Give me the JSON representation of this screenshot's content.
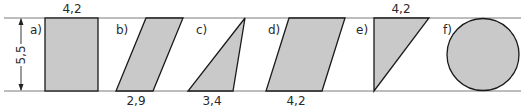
{
  "figure": {
    "height_label": "5,5",
    "fill_color": "#c9c9c9",
    "stroke_color": "#1a1a1a",
    "shapes": [
      {
        "id": "a",
        "label": "a)",
        "type": "rectangle",
        "dimension": "4,2",
        "dimension_position": "top"
      },
      {
        "id": "b",
        "label": "b)",
        "type": "parallelogram",
        "dimension": "2,9",
        "dimension_position": "bottom"
      },
      {
        "id": "c",
        "label": "c)",
        "type": "triangle",
        "dimension": "3,4",
        "dimension_position": "bottom"
      },
      {
        "id": "d",
        "label": "d)",
        "type": "parallelogram",
        "dimension": "4,2",
        "dimension_position": "bottom"
      },
      {
        "id": "e",
        "label": "e)",
        "type": "right-triangle",
        "dimension": "4,2",
        "dimension_position": "top"
      },
      {
        "id": "f",
        "label": "f)",
        "type": "circle",
        "dimension": "",
        "dimension_position": ""
      }
    ]
  }
}
